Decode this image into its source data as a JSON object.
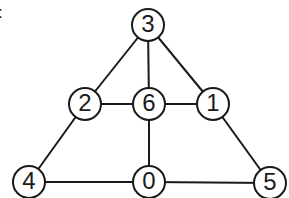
{
  "caption_fragment": ":",
  "graph": {
    "nodes": [
      {
        "id": "3",
        "label": "3",
        "x": 148,
        "y": 25
      },
      {
        "id": "2",
        "label": "2",
        "x": 85,
        "y": 104
      },
      {
        "id": "6",
        "label": "6",
        "x": 149,
        "y": 104
      },
      {
        "id": "1",
        "label": "1",
        "x": 213,
        "y": 104
      },
      {
        "id": "4",
        "label": "4",
        "x": 29,
        "y": 182
      },
      {
        "id": "0",
        "label": "0",
        "x": 149,
        "y": 182
      },
      {
        "id": "5",
        "label": "5",
        "x": 270,
        "y": 183
      }
    ],
    "edges": [
      [
        "3",
        "2"
      ],
      [
        "3",
        "6"
      ],
      [
        "3",
        "1"
      ],
      [
        "2",
        "6"
      ],
      [
        "6",
        "1"
      ],
      [
        "2",
        "4"
      ],
      [
        "6",
        "0"
      ],
      [
        "1",
        "5"
      ],
      [
        "4",
        "0"
      ],
      [
        "0",
        "5"
      ]
    ],
    "node_radius": 16,
    "stroke_color": "#1a1a1a",
    "fill_color": "#ffffff"
  }
}
